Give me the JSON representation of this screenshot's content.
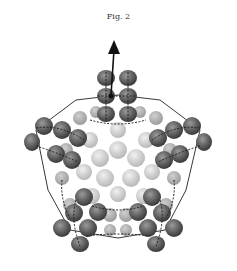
{
  "figure": {
    "caption": "Fig. 2",
    "colors": {
      "dark_sphere": "#5a5a5a",
      "mid_sphere": "#8a8a8a",
      "light_sphere": "#c8c8c8",
      "edge": "#222222",
      "background": "#ffffff"
    },
    "arrow": {
      "direction": "up",
      "from": [
        113,
        95
      ],
      "to": [
        113,
        42
      ]
    },
    "pentagon_vertices": [
      [
        118,
        78
      ],
      [
        200,
        138
      ],
      [
        170,
        232
      ],
      [
        66,
        232
      ],
      [
        36,
        138
      ]
    ]
  }
}
